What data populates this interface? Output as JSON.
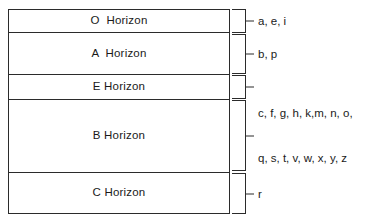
{
  "diagram": {
    "line_color": "#2b2b2b",
    "background": "#ffffff",
    "horizons": [
      {
        "id": "o-horizon",
        "label": "O  Horizon",
        "descriptors": "a, e, i",
        "descriptor_lines": [
          "a, e, i"
        ]
      },
      {
        "id": "a-horizon",
        "label": "A  Horizon",
        "descriptors": "b, p",
        "descriptor_lines": [
          "b, p"
        ]
      },
      {
        "id": "e-horizon",
        "label": "E Horizon",
        "descriptors": "",
        "descriptor_lines": []
      },
      {
        "id": "b-horizon",
        "label": "B Horizon",
        "descriptors": "c, f, g, h, k,m, n, o, q, s, t, v, w, x, y, z",
        "descriptor_lines": [
          "c, f, g, h, k,m, n, o,",
          "q, s, t, v, w, x, y, z"
        ]
      },
      {
        "id": "c-horizon",
        "label": "C Horizon",
        "descriptors": "r",
        "descriptor_lines": [
          "r"
        ]
      }
    ]
  }
}
